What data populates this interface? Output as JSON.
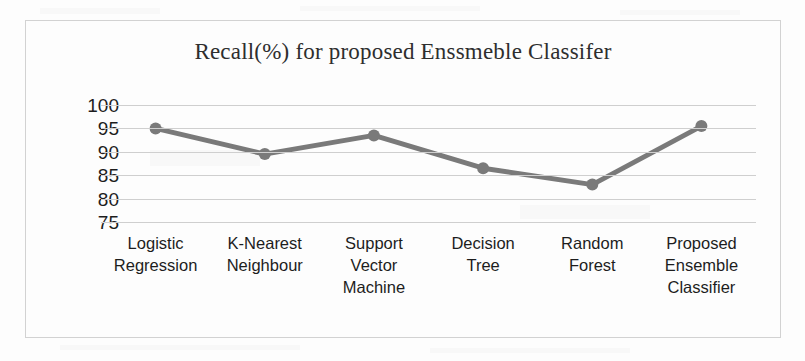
{
  "chart_data": {
    "type": "line",
    "title": "Recall(%) for proposed Enssmeble Classifer",
    "xlabel": "",
    "ylabel": "",
    "ylim": [
      75,
      100
    ],
    "yticks": [
      100,
      95,
      90,
      85,
      80,
      75
    ],
    "grid": true,
    "legend": false,
    "legend_position": "none",
    "categories": [
      "Logistic Regression",
      "K-Nearest Neighbour",
      "Support Vector Machine",
      "Decision Tree",
      "Random Forest",
      "Proposed Ensemble Classifier"
    ],
    "category_lines": [
      [
        "Logistic",
        "Regression"
      ],
      [
        "K-Nearest",
        "Neighbour"
      ],
      [
        "Support",
        "Vector",
        "Machine"
      ],
      [
        "Decision",
        "Tree"
      ],
      [
        "Random",
        "Forest"
      ],
      [
        "Proposed",
        "Ensemble",
        "Classifier"
      ]
    ],
    "series": [
      {
        "name": "Recall(%)",
        "values": [
          95.0,
          89.5,
          93.5,
          86.5,
          83.0,
          95.5
        ],
        "color": "#7a7a7a",
        "marker": "circle"
      }
    ]
  },
  "style": {
    "line_color": "#7a7a7a",
    "grid_color": "#cfcfcf",
    "frame_color": "#d2d2d2",
    "text_color": "#1d1d1d",
    "title_color": "#2e2e2e",
    "background": "#fdfdfd"
  }
}
